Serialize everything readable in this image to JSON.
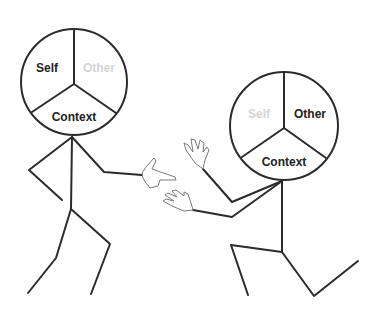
{
  "figures": [
    {
      "id": "left",
      "head_labels": {
        "self": "Self",
        "other": "Other",
        "context": "Context"
      },
      "highlighted": "self",
      "dimmed": "other"
    },
    {
      "id": "right",
      "head_labels": {
        "self": "Self",
        "other": "Other",
        "context": "Context"
      },
      "highlighted": "other",
      "dimmed": "self"
    }
  ],
  "colors": {
    "line": "#2b2b2b",
    "text": "#222222",
    "dim_text": "#d4d4d4",
    "hand": "#7a7a7a"
  }
}
